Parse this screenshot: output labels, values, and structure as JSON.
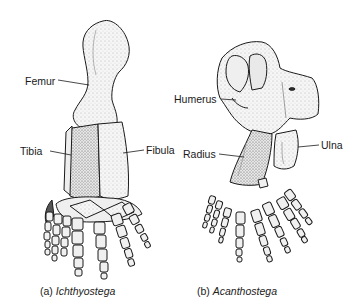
{
  "figure": {
    "panels": [
      {
        "id": "a",
        "caption_prefix": "(a)",
        "caption_taxon": "Ichthyostega",
        "labels": {
          "femur": "Femur",
          "tibia": "Tibia",
          "fibula": "Fibula"
        }
      },
      {
        "id": "b",
        "caption_prefix": "(b)",
        "caption_taxon": "Acanthostega",
        "labels": {
          "humerus": "Humerus",
          "radius": "Radius",
          "ulna": "Ulna"
        }
      }
    ],
    "colors": {
      "ink": "#1a1a1a",
      "bone_fill": "#f4f4f4",
      "shade": "#c8c8c8",
      "background": "#ffffff"
    }
  }
}
